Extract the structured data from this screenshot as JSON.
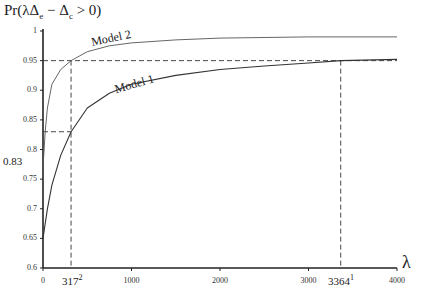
{
  "chart_data": {
    "type": "line",
    "title": "",
    "ylabel_parts": {
      "pre": "Pr(λΔ",
      "sub1": "e",
      "mid": " − Δ",
      "sub2": "c",
      "post": " > 0)"
    },
    "xlabel": "λ",
    "xlim": [
      0,
      4000
    ],
    "ylim": [
      0.6,
      1.0
    ],
    "x_ticks": [
      "0",
      "1000",
      "2000",
      "3000",
      "4000"
    ],
    "y_ticks": [
      "0.6",
      "0.65",
      "0.7",
      "0.75",
      "0.8",
      "0.85",
      "0.9",
      "0.95",
      "1"
    ],
    "grid": false,
    "series": [
      {
        "name": "Model 1",
        "x": [
          0,
          50,
          100,
          200,
          317,
          500,
          750,
          1000,
          1500,
          2000,
          2500,
          3000,
          3364,
          4000
        ],
        "values": [
          0.65,
          0.7,
          0.74,
          0.79,
          0.83,
          0.87,
          0.895,
          0.91,
          0.925,
          0.935,
          0.941,
          0.946,
          0.95,
          0.952
        ]
      },
      {
        "name": "Model 2",
        "x": [
          0,
          25,
          50,
          100,
          200,
          317,
          500,
          750,
          1000,
          1500,
          2000,
          3000,
          4000
        ],
        "values": [
          0.77,
          0.83,
          0.87,
          0.91,
          0.935,
          0.95,
          0.965,
          0.975,
          0.98,
          0.985,
          0.988,
          0.99,
          0.99
        ]
      }
    ],
    "annotations": {
      "hline_095": 0.95,
      "hline_083": 0.83,
      "vline_317": 317,
      "vline_3364": 3364,
      "label_083": "0.83",
      "label_317": "317",
      "label_317_sup": "2",
      "label_3364": "3364",
      "label_3364_sup": "1"
    }
  }
}
